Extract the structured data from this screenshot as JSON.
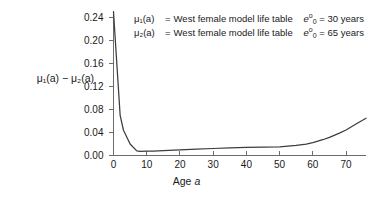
{
  "chart_data": {
    "type": "line",
    "title": "",
    "xlabel": "Age a",
    "ylabel": "μ₁(a) − μ₂(a)",
    "xlim": [
      0,
      76
    ],
    "ylim": [
      0,
      0.25
    ],
    "grid": false,
    "legend_position": "top-left-inside",
    "x_ticks": [
      0,
      10,
      20,
      30,
      40,
      50,
      60,
      70
    ],
    "x_tick_labels": [
      "0",
      "10",
      "20",
      "30",
      "40",
      "50",
      "60",
      "70"
    ],
    "y_ticks": [
      0.0,
      0.04,
      0.08,
      0.12,
      0.16,
      0.2,
      0.24
    ],
    "y_tick_labels": [
      "0.00",
      "0.04",
      "0.08",
      "0.12",
      "0.16",
      "0.20",
      "0.24"
    ],
    "series": [
      {
        "name": "μ₁(a) − μ₂(a)",
        "color": "#3d3d3d",
        "x": [
          0,
          1,
          2,
          3,
          5,
          7,
          8,
          10,
          12,
          15,
          20,
          25,
          30,
          35,
          40,
          45,
          50,
          55,
          58,
          60,
          63,
          65,
          68,
          70,
          73,
          76
        ],
        "values": [
          0.2505,
          0.16,
          0.07,
          0.044,
          0.02,
          0.008,
          0.0072,
          0.0075,
          0.0078,
          0.0085,
          0.0098,
          0.011,
          0.0122,
          0.0132,
          0.014,
          0.0145,
          0.015,
          0.0175,
          0.02,
          0.0225,
          0.0275,
          0.0315,
          0.039,
          0.0445,
          0.055,
          0.065
        ]
      }
    ]
  },
  "legend": {
    "rows": [
      {
        "symbol": "μ₁(a)",
        "equals": "=",
        "description": "West female model life table",
        "life_expectancy_label": "e",
        "life_expectancy_sup": "o",
        "life_expectancy_sub": "0",
        "life_expectancy_value": "= 30 years"
      },
      {
        "symbol": "μ₂(a)",
        "equals": "=",
        "description": "West female model life table",
        "life_expectancy_label": "e",
        "life_expectancy_sup": "o",
        "life_expectancy_sub": "0",
        "life_expectancy_value": "= 65 years"
      }
    ]
  },
  "axes": {
    "y_title": "μ₁(a) − μ₂(a)",
    "x_title_prefix": "Age",
    "x_title_var": "a"
  },
  "style": {
    "line_color": "#3d3d3d",
    "axis_color": "#6b6b6b",
    "text_color": "#1a1a1a",
    "background": "#ffffff"
  }
}
